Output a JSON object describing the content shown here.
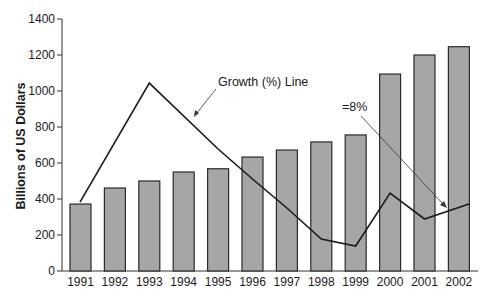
{
  "chart_data": {
    "type": "bar",
    "title": "",
    "xlabel": "",
    "ylabel": "Billions of US Dollars",
    "ylim": [
      0,
      1400
    ],
    "yticks": [
      0,
      200,
      400,
      600,
      800,
      1000,
      1200,
      1400
    ],
    "grid": false,
    "legend": null,
    "categories": [
      "1991",
      "1992",
      "1993",
      "1994",
      "1995",
      "1996",
      "1997",
      "1998",
      "1999",
      "2000",
      "2001",
      "2002"
    ],
    "series": [
      {
        "name": "Billions of US Dollars",
        "type": "bar",
        "color": "#a6a6a6",
        "values": [
          372,
          461,
          500,
          550,
          568,
          633,
          672,
          717,
          756,
          1094,
          1200,
          1246
        ]
      },
      {
        "name": "Growth (%) Line",
        "type": "line",
        "color": "#1a1a1a",
        "values_in_axis_units": [
          383,
          null,
          1044,
          null,
          678,
          511,
          350,
          178,
          139,
          433,
          289,
          372
        ],
        "points_x": [
          1991,
          1993,
          1995,
          1996,
          1997,
          1998,
          1999,
          2000,
          2001,
          2002
        ],
        "points_y": [
          383,
          1044,
          678,
          511,
          350,
          178,
          139,
          433,
          289,
          372
        ]
      }
    ],
    "annotations": [
      {
        "text": "Growth (%) Line",
        "points_to": "growth line between 1994 and 1995"
      },
      {
        "text": "=8%",
        "points_to": "growth line at 2002"
      }
    ]
  }
}
